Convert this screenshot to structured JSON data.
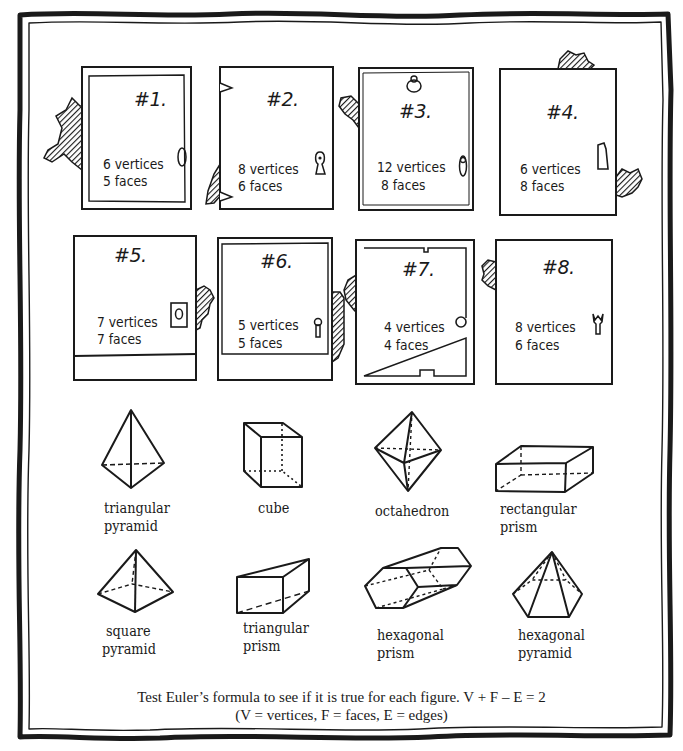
{
  "doors": [
    {
      "number": "#1.",
      "vertices_label": "6 vertices",
      "faces_label": "5 faces",
      "vertices": 6,
      "faces": 5,
      "handle": "oval-knob-icon"
    },
    {
      "number": "#2.",
      "vertices_label": "8 vertices",
      "faces_label": "6 faces",
      "vertices": 8,
      "faces": 6,
      "handle": "keyhole-icon"
    },
    {
      "number": "#3.",
      "vertices_label": "12 vertices",
      "faces_label": "8 faces",
      "vertices": 12,
      "faces": 8,
      "handle": "lever-handle-icon"
    },
    {
      "number": "#4.",
      "vertices_label": "6 vertices",
      "faces_label": "8 faces",
      "vertices": 6,
      "faces": 8,
      "handle": "latch-icon"
    },
    {
      "number": "#5.",
      "vertices_label": "7 vertices",
      "faces_label": "7 faces",
      "vertices": 7,
      "faces": 7,
      "handle": "plate-knob-icon"
    },
    {
      "number": "#6.",
      "vertices_label": "5 vertices",
      "faces_label": "5 faces",
      "vertices": 5,
      "faces": 5,
      "handle": "keyhole-icon"
    },
    {
      "number": "#7.",
      "vertices_label": "4 vertices",
      "faces_label": "4 faces",
      "vertices": 4,
      "faces": 4,
      "handle": "round-knob-icon"
    },
    {
      "number": "#8.",
      "vertices_label": "8 vertices",
      "faces_label": "6 faces",
      "vertices": 8,
      "faces": 6,
      "handle": "ornate-handle-icon"
    }
  ],
  "shapes": [
    {
      "line1": "triangular",
      "line2": "pyramid"
    },
    {
      "line1": "cube",
      "line2": ""
    },
    {
      "line1": "octahedron",
      "line2": ""
    },
    {
      "line1": "rectangular",
      "line2": "prism"
    },
    {
      "line1": "square",
      "line2": "pyramid"
    },
    {
      "line1": "triangular",
      "line2": "prism"
    },
    {
      "line1": "hexagonal",
      "line2": "prism"
    },
    {
      "line1": "hexagonal",
      "line2": "pyramid"
    }
  ],
  "instruction": {
    "line1": "Test Euler’s formula to see if it is true for each figure. V + F – E = 2",
    "line2": "(V = vertices, F = faces, E = edges)"
  },
  "colors": {
    "ink": "#1a1a1a",
    "paper": "#ffffff"
  }
}
